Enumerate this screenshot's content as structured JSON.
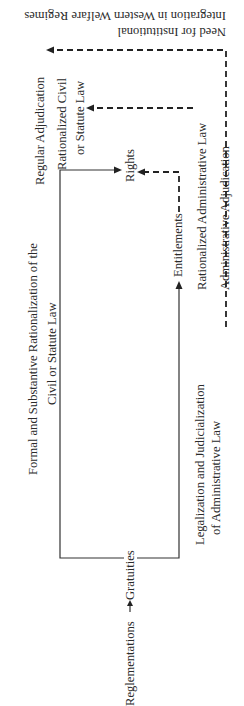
{
  "figure": {
    "caption_line1": "Need for Institutional",
    "caption_line2": "Integration in Western Welfare Regimes",
    "nodes": {
      "regular_adjudication": "Regular Adjudication",
      "rationalized_civil_line1": "Rationalized Civil",
      "rationalized_civil_line2": "or Statute Law",
      "rights": "Rights",
      "entitlements": "Entitlements",
      "rationalized_admin_law": "Rationalized Administrative Law",
      "administrative_adjudication": "Administrative Adjudication",
      "reglementations": "Reglementations",
      "gratuities": "Gratuities"
    },
    "edge_labels": {
      "formal_line1": "Formal and Substantive Rationalization of the",
      "formal_line2": "Civil or Statute Law",
      "legalization_line1": "Legalization and Judicialization",
      "legalization_line2": "of Administrative Law"
    },
    "edges": [
      {
        "from": "Gratuities",
        "to": "Rights",
        "style": "solid",
        "via": "Formal and Substantive Rationalization of the Civil or Statute Law"
      },
      {
        "from": "Gratuities",
        "to": "Entitlements",
        "style": "solid",
        "via": "Legalization and Judicialization of Administrative Law"
      },
      {
        "from": "Entitlements",
        "to": "Rights",
        "style": "dashed"
      },
      {
        "from": "Rationalized Administrative Law",
        "to": "Rationalized Civil or Statute Law",
        "style": "dashed"
      },
      {
        "from": "Administrative Adjudication",
        "to": "Regular Adjudication",
        "style": "dashed"
      },
      {
        "from": "Reglementations",
        "to": "Gratuities",
        "style": "solid"
      }
    ]
  }
}
